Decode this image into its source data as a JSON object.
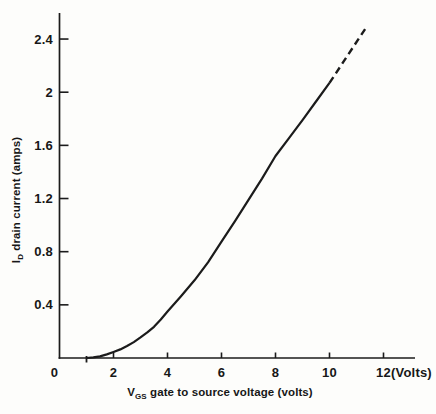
{
  "figure": {
    "background": "#fdfdfb",
    "curve_color": "#1b1b1b",
    "axis_color": "#1b1b1b"
  },
  "y_axis": {
    "title_main": "I",
    "title_sub": "D",
    "title_rest": " drain current (amps)",
    "ticks": [
      {
        "label": "2.4",
        "amps": 2.4
      },
      {
        "label": "2",
        "amps": 2.0
      },
      {
        "label": "1.6",
        "amps": 1.6
      },
      {
        "label": "1.2",
        "amps": 1.2
      },
      {
        "label": "0.8",
        "amps": 0.8
      },
      {
        "label": "0.4",
        "amps": 0.4
      }
    ]
  },
  "x_axis": {
    "title_main": "V",
    "title_sub": "GS",
    "title_rest": " gate to source voltage (volts)",
    "origin_label": "0",
    "unit_label": "(Volts)",
    "ticks": [
      {
        "label": "2",
        "volts": 2
      },
      {
        "label": "4",
        "volts": 4
      },
      {
        "label": "6",
        "volts": 6
      },
      {
        "label": "8",
        "volts": 8
      },
      {
        "label": "10",
        "volts": 10
      },
      {
        "label": "12",
        "volts": 12
      }
    ]
  },
  "chart_data": {
    "type": "line",
    "title": "",
    "xlabel": "VGS gate to source voltage (volts)",
    "ylabel": "ID drain current (amps)",
    "xlim": [
      0,
      13.2
    ],
    "ylim": [
      0,
      2.62
    ],
    "grid": false,
    "legend": "none",
    "x_ticks": [
      2,
      4,
      6,
      8,
      10,
      12
    ],
    "y_ticks": [
      0.4,
      0.8,
      1.2,
      1.6,
      2.0,
      2.4
    ],
    "threshold_voltage": 1,
    "series": [
      {
        "name": "drain current (measured, solid)",
        "style": "solid",
        "x": [
          1,
          1.25,
          1.5,
          1.75,
          2,
          2.25,
          2.5,
          2.75,
          3,
          3.25,
          3.5,
          3.75,
          4,
          4.5,
          5,
          5.5,
          6,
          6.5,
          7,
          7.5,
          8,
          8.5,
          9,
          9.5,
          10
        ],
        "y": [
          0,
          0.005,
          0.012,
          0.027,
          0.045,
          0.065,
          0.09,
          0.12,
          0.155,
          0.193,
          0.235,
          0.29,
          0.35,
          0.465,
          0.585,
          0.72,
          0.875,
          1.03,
          1.19,
          1.35,
          1.52,
          1.655,
          1.79,
          1.93,
          2.07
        ]
      },
      {
        "name": "extrapolated (dashed)",
        "style": "dashed",
        "x": [
          10,
          10.7,
          11.4
        ],
        "y": [
          2.07,
          2.285,
          2.5
        ]
      }
    ]
  }
}
